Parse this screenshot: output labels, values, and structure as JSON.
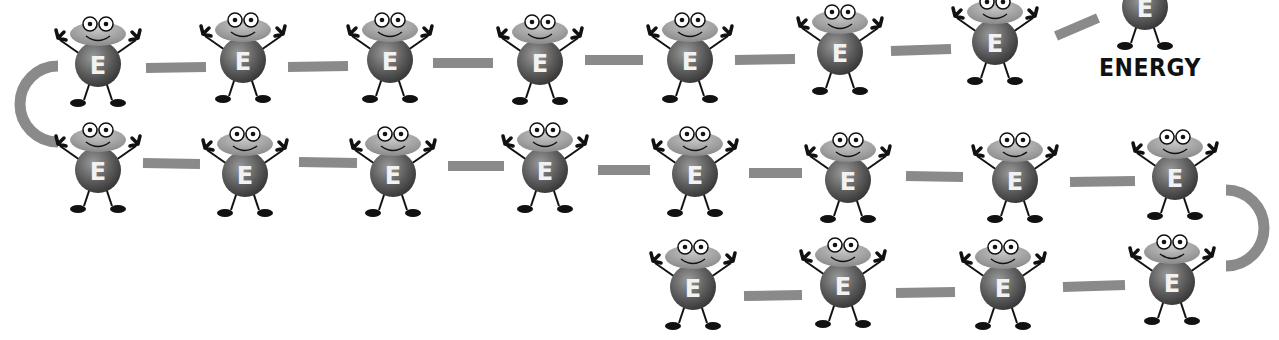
{
  "illustration": {
    "label": "ENERGY",
    "character_letter": "E",
    "colors": {
      "background": "#ffffff",
      "link": "#8a8a8a",
      "hat": "#9a9a9a",
      "body": "#555555",
      "limbs": "#111111",
      "eye": "#ffffff",
      "letter": "#f2f2f2"
    },
    "characters": [
      {
        "row": 1,
        "x": 98,
        "y": 62
      },
      {
        "row": 1,
        "x": 243,
        "y": 58
      },
      {
        "row": 1,
        "x": 390,
        "y": 58
      },
      {
        "row": 1,
        "x": 540,
        "y": 60
      },
      {
        "row": 1,
        "x": 690,
        "y": 58
      },
      {
        "row": 1,
        "x": 840,
        "y": 50
      },
      {
        "row": 1,
        "x": 995,
        "y": 40
      },
      {
        "row": 1,
        "x": 1145,
        "y": 5
      },
      {
        "row": 2,
        "x": 98,
        "y": 168
      },
      {
        "row": 2,
        "x": 245,
        "y": 172
      },
      {
        "row": 2,
        "x": 393,
        "y": 172
      },
      {
        "row": 2,
        "x": 545,
        "y": 168
      },
      {
        "row": 2,
        "x": 695,
        "y": 172
      },
      {
        "row": 2,
        "x": 848,
        "y": 178
      },
      {
        "row": 2,
        "x": 1015,
        "y": 178
      },
      {
        "row": 2,
        "x": 1175,
        "y": 175
      },
      {
        "row": 3,
        "x": 693,
        "y": 285
      },
      {
        "row": 3,
        "x": 843,
        "y": 283
      },
      {
        "row": 3,
        "x": 1003,
        "y": 285
      },
      {
        "row": 3,
        "x": 1172,
        "y": 280
      }
    ],
    "links": [
      {
        "x1": 146,
        "y1": 68,
        "x2": 206,
        "y2": 67
      },
      {
        "x1": 288,
        "y1": 67,
        "x2": 348,
        "y2": 66
      },
      {
        "x1": 433,
        "y1": 63,
        "x2": 493,
        "y2": 63
      },
      {
        "x1": 585,
        "y1": 60,
        "x2": 643,
        "y2": 60
      },
      {
        "x1": 735,
        "y1": 60,
        "x2": 795,
        "y2": 59
      },
      {
        "x1": 891,
        "y1": 51,
        "x2": 951,
        "y2": 49
      },
      {
        "x1": 1056,
        "y1": 36,
        "x2": 1098,
        "y2": 18
      },
      {
        "x1": 143,
        "y1": 163,
        "x2": 200,
        "y2": 164
      },
      {
        "x1": 299,
        "y1": 162,
        "x2": 357,
        "y2": 163
      },
      {
        "x1": 448,
        "y1": 166,
        "x2": 504,
        "y2": 166
      },
      {
        "x1": 598,
        "y1": 170,
        "x2": 650,
        "y2": 170
      },
      {
        "x1": 749,
        "y1": 173,
        "x2": 802,
        "y2": 173
      },
      {
        "x1": 906,
        "y1": 176,
        "x2": 963,
        "y2": 177
      },
      {
        "x1": 1070,
        "y1": 182,
        "x2": 1135,
        "y2": 181
      },
      {
        "x1": 744,
        "y1": 296,
        "x2": 802,
        "y2": 295
      },
      {
        "x1": 896,
        "y1": 293,
        "x2": 955,
        "y2": 292
      },
      {
        "x1": 1063,
        "y1": 287,
        "x2": 1125,
        "y2": 285
      }
    ],
    "arcs": [
      {
        "side": "left",
        "cx": 46,
        "cy": 104,
        "r": 38
      },
      {
        "side": "right",
        "cx": 1238,
        "cy": 228,
        "r": 38
      }
    ]
  }
}
